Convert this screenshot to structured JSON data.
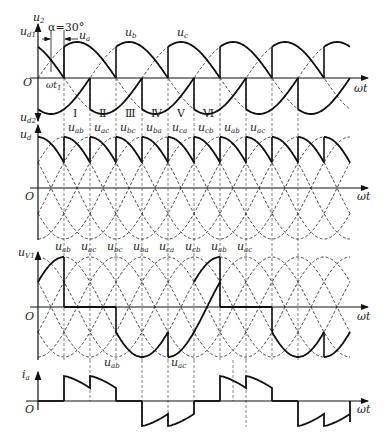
{
  "figure": {
    "alpha_label": "α=30°",
    "omega_t_label": "ωt",
    "origin_label": "O",
    "panels": [
      {
        "id": "phase-voltages",
        "y_labels": [
          "u2",
          "ud1",
          "ud2"
        ],
        "y_label_text": {
          "u2": "u",
          "u2_sub": "2",
          "ud1": "u",
          "ud1_sub": "d1",
          "ud2": "u",
          "ud2_sub": "d2"
        },
        "curve_labels": [
          {
            "main": "u",
            "sub": "a"
          },
          {
            "main": "u",
            "sub": "b"
          },
          {
            "main": "u",
            "sub": "c"
          }
        ],
        "marker_label": {
          "main": "ωt",
          "sub": "1"
        }
      },
      {
        "id": "output-voltage",
        "y_label": {
          "main": "u",
          "sub": "d"
        },
        "interval_numerals": [
          "Ⅰ",
          "Ⅱ",
          "Ⅲ",
          "Ⅳ",
          "Ⅴ",
          "Ⅵ"
        ],
        "conducting_voltages": [
          {
            "main": "u",
            "sub": "ab"
          },
          {
            "main": "u",
            "sub": "ac"
          },
          {
            "main": "u",
            "sub": "bc"
          },
          {
            "main": "u",
            "sub": "ba"
          },
          {
            "main": "u",
            "sub": "ca"
          },
          {
            "main": "u",
            "sub": "cb"
          },
          {
            "main": "u",
            "sub": "ab"
          },
          {
            "main": "u",
            "sub": "ac"
          }
        ]
      },
      {
        "id": "thyristor-voltage",
        "y_label": {
          "main": "u",
          "sub": "V1"
        },
        "top_labels": [
          {
            "main": "u",
            "sub": "ab"
          },
          {
            "main": "u",
            "sub": "ac"
          },
          {
            "main": "u",
            "sub": "bc"
          },
          {
            "main": "u",
            "sub": "ba"
          },
          {
            "main": "u",
            "sub": "ca"
          },
          {
            "main": "u",
            "sub": "cb"
          },
          {
            "main": "u",
            "sub": "ab"
          },
          {
            "main": "u",
            "sub": "ac"
          }
        ],
        "bottom_labels": [
          {
            "main": "u",
            "sub": "ab"
          },
          {
            "main": "u",
            "sub": "ac"
          }
        ]
      },
      {
        "id": "phase-current",
        "y_label": {
          "main": "i",
          "sub": "a"
        }
      }
    ]
  }
}
